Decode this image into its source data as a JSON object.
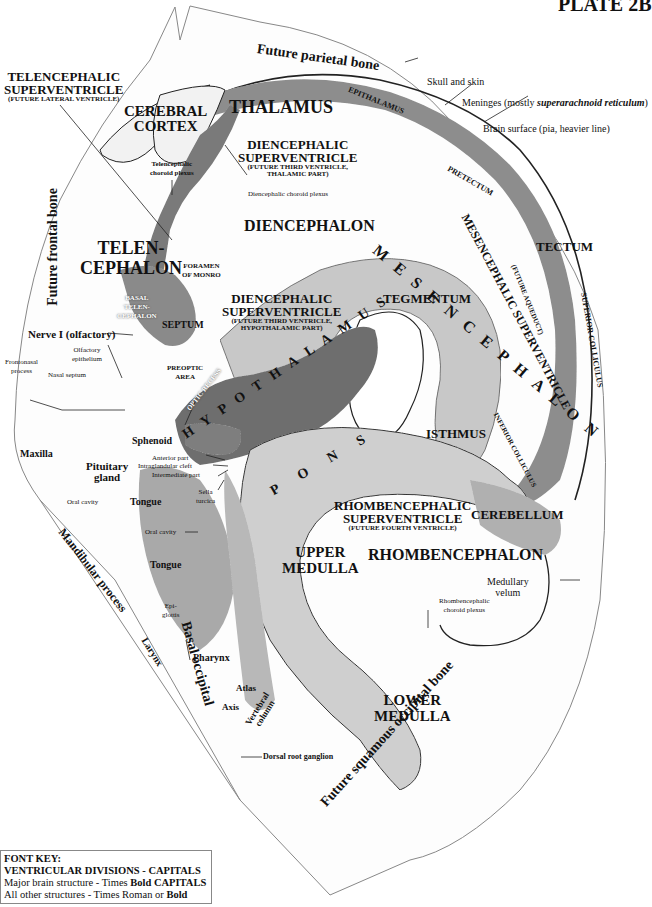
{
  "plate": {
    "title": "PLATE 2B"
  },
  "bones": {
    "parietal": "Future parietal bone",
    "frontal": "Future frontal bone",
    "squamous_occipital": "Future squamous occipital bone",
    "basal_occipital": "Basal occipital",
    "mandibular": "Mandibular process"
  },
  "surface_labels": {
    "skull": "Skull and skin",
    "meninges_prefix": "Meninges (mostly ",
    "meninges_italic": "superarachnoid reticulum",
    "meninges_suffix": ")",
    "brain_surface": "Brain surface (pia, heavier line)"
  },
  "ventricles": {
    "telencephalic": {
      "title": "TELENCEPHALIC",
      "title2": "SUPERVENTRICLE",
      "note": "(FUTURE LATERAL VENTRICLE)"
    },
    "diencephalic_thalamic": {
      "title": "DIENCEPHALIC",
      "title2": "SUPERVENTRICLE",
      "note": "(FUTURE THIRD VENTRICLE,",
      "note2": "THALAMIC PART)"
    },
    "diencephalic_hypothalamic": {
      "title": "DIENCEPHALIC",
      "title2": "SUPERVENTRICLE",
      "note": "(FUTURE THIRD VENTRICLE,",
      "note2": "HYPOTHALAMIC PART)"
    },
    "mesencephalic": {
      "title": "MESENCEPHALIC SUPERVENTRICLE",
      "note": "(FUTURE AQUEDUCT)"
    },
    "rhombencephalic": {
      "title": "RHOMBENCEPHALIC",
      "title2": "SUPERVENTRICLE",
      "note": "(FUTURE FOURTH VENTRICLE)"
    }
  },
  "divisions": {
    "telencephalon_1": "TELEN-",
    "telencephalon_2": "CEPHALON",
    "diencephalon": "DIENCEPHALON",
    "mesencephalon": "M E S E N C E P H A L O N",
    "rhombencephalon": "RHOMBENCEPHALON"
  },
  "brain_structures": {
    "cerebral_cortex_1": "CEREBRAL",
    "cerebral_cortex_2": "CORTEX",
    "thalamus": "THALAMUS",
    "epithalamus": "EPITHALAMUS",
    "pretectum": "PRETECTUM",
    "tectum": "TECTUM",
    "superior_colliculus": "SUPERIOR COLLICULUS",
    "inferior_colliculus": "INFERIOR COLLICULUS",
    "tegmentum": "TEGMENTUM",
    "hypothalamus": "H Y P O T H A L A M U S",
    "pons": "P O N S",
    "isthmus": "ISTHMUS",
    "cerebellum": "CEREBELLUM",
    "upper_medulla_1": "UPPER",
    "upper_medulla_2": "MEDULLA",
    "lower_medulla_1": "LOWER",
    "lower_medulla_2": "MEDULLA",
    "basal_telencephalon_1": "BASAL",
    "basal_telencephalon_2": "TELEN-",
    "basal_telencephalon_3": "CEPHALON",
    "septum": "SEPTUM",
    "preoptic_1": "PREOPTIC",
    "preoptic_2": "AREA",
    "optic_recess": "OPTIC RECESS",
    "foramen_1": "FORAMEN",
    "foramen_2": "OF MONRO"
  },
  "other_structures": {
    "telencephalic_choroid_1": "Telencephalic",
    "telencephalic_choroid_2": "choroid plexus",
    "diencephalic_choroid": "Diencephalic choroid plexus",
    "rhombencephalic_choroid_1": "Rhombencephalic",
    "rhombencephalic_choroid_2": "choroid plexus",
    "medullary_velum_1": "Medullary",
    "medullary_velum_2": "velum",
    "nerve_i": "Nerve I (olfactory)",
    "olfactory_1": "Olfactory",
    "olfactory_2": "epithelium",
    "frontonasal_1": "Frontonasal",
    "frontonasal_2": "process",
    "nasal_septum": "Nasal septum",
    "maxilla": "Maxilla",
    "sphenoid": "Sphenoid",
    "pituitary_1": "Pituitary",
    "pituitary_2": "gland",
    "anterior_part": "Anterior part",
    "intraglandular_cleft": "Intraglandular cleft",
    "intermediate_part": "Intermediate part",
    "sella_1": "Sella",
    "sella_2": "turcica",
    "oral_cavity_upper": "Oral cavity",
    "oral_cavity_lower": "Oral cavity",
    "tongue_upper": "Tongue",
    "tongue_lower": "Tongue",
    "epiglottis_1": "Epi-",
    "epiglottis_2": "glottis",
    "larynx": "Larynx",
    "pharynx": "Pharynx",
    "atlas": "Atlas",
    "axis": "Axis",
    "vertebral_1": "Vertebral",
    "vertebral_2": "column",
    "dorsal_root": "Dorsal root ganglion"
  },
  "font_key": {
    "title": "FONT KEY:",
    "line1": "VENTRICULAR DIVISIONS  -  CAPITALS",
    "line2_prefix": "Major brain structure - Times ",
    "line2_bold": "Bold CAPITALS",
    "line3_prefix": "All other structures - Times Roman or ",
    "line3_bold": "Bold"
  },
  "colors": {
    "tissue_dark": "#6e6e6e",
    "tissue_mid": "#9a9a9a",
    "tissue_light": "#d8d8d8",
    "outline": "#222222",
    "background": "#ffffff"
  }
}
